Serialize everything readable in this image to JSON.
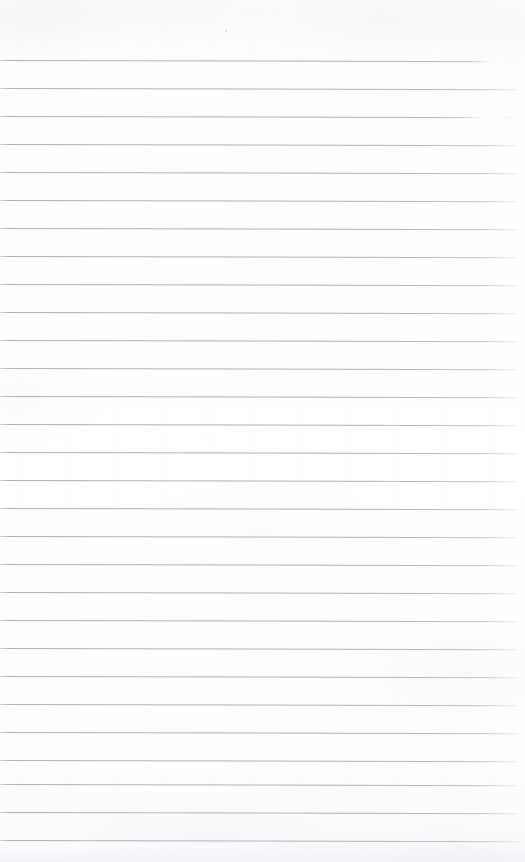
{
  "document": {
    "type": "scanned-ruled-paper",
    "title": "Blank ruled notebook page",
    "content_text": "",
    "page_width": 525,
    "page_height": 862,
    "background_color": "#fdfdfe",
    "rule_color": "#aab2c0",
    "rule_thickness": 1,
    "rule_spacing": 28,
    "first_rule_y": 60,
    "last_rule_y": 840,
    "rule_left_x": 0,
    "rule_right_x": 517,
    "rule_count": 29,
    "has_margin_rule": false,
    "tilt_degrees": 0.13
  },
  "rules": [
    {
      "index": 1,
      "y": 60,
      "right": 517,
      "faded_from": 470,
      "faded_width": 55
    },
    {
      "index": 2,
      "y": 88,
      "right": 517,
      "faded_from": null,
      "faded_width": 0
    },
    {
      "index": 3,
      "y": 116,
      "right": 517,
      "faded_from": 455,
      "faded_width": 70
    },
    {
      "index": 4,
      "y": 144,
      "right": 517,
      "faded_from": null,
      "faded_width": 0
    },
    {
      "index": 5,
      "y": 172,
      "right": 517,
      "faded_from": null,
      "faded_width": 0
    },
    {
      "index": 6,
      "y": 200,
      "right": 517,
      "faded_from": null,
      "faded_width": 0
    },
    {
      "index": 7,
      "y": 228,
      "right": 517,
      "faded_from": null,
      "faded_width": 0
    },
    {
      "index": 8,
      "y": 256,
      "right": 517,
      "faded_from": null,
      "faded_width": 0
    },
    {
      "index": 9,
      "y": 284,
      "right": 517,
      "faded_from": null,
      "faded_width": 0
    },
    {
      "index": 10,
      "y": 312,
      "right": 517,
      "faded_from": null,
      "faded_width": 0
    },
    {
      "index": 11,
      "y": 340,
      "right": 517,
      "faded_from": null,
      "faded_width": 0
    },
    {
      "index": 12,
      "y": 368,
      "right": 517,
      "faded_from": null,
      "faded_width": 0
    },
    {
      "index": 13,
      "y": 396,
      "right": 517,
      "faded_from": null,
      "faded_width": 0
    },
    {
      "index": 14,
      "y": 424,
      "right": 517,
      "faded_from": null,
      "faded_width": 0
    },
    {
      "index": 15,
      "y": 452,
      "right": 517,
      "faded_from": null,
      "faded_width": 0
    },
    {
      "index": 16,
      "y": 480,
      "right": 517,
      "faded_from": null,
      "faded_width": 0
    },
    {
      "index": 17,
      "y": 508,
      "right": 517,
      "faded_from": null,
      "faded_width": 0
    },
    {
      "index": 18,
      "y": 536,
      "right": 517,
      "faded_from": null,
      "faded_width": 0
    },
    {
      "index": 19,
      "y": 564,
      "right": 517,
      "faded_from": null,
      "faded_width": 0
    },
    {
      "index": 20,
      "y": 592,
      "right": 517,
      "faded_from": null,
      "faded_width": 0
    },
    {
      "index": 21,
      "y": 620,
      "right": 517,
      "faded_from": null,
      "faded_width": 0
    },
    {
      "index": 22,
      "y": 648,
      "right": 517,
      "faded_from": null,
      "faded_width": 0
    },
    {
      "index": 23,
      "y": 676,
      "right": 517,
      "faded_from": null,
      "faded_width": 0
    },
    {
      "index": 24,
      "y": 704,
      "right": 517,
      "faded_from": null,
      "faded_width": 0
    },
    {
      "index": 25,
      "y": 732,
      "right": 517,
      "faded_from": null,
      "faded_width": 0
    },
    {
      "index": 26,
      "y": 760,
      "right": 517,
      "faded_from": null,
      "faded_width": 0
    },
    {
      "index": 27,
      "y": 784,
      "right": 517,
      "faded_from": null,
      "faded_width": 0
    },
    {
      "index": 28,
      "y": 812,
      "right": 517,
      "faded_from": null,
      "faded_width": 0
    },
    {
      "index": 29,
      "y": 840,
      "right": 521,
      "faded_from": null,
      "faded_width": 0
    }
  ],
  "artifacts": [
    {
      "kind": "speck",
      "x": 225,
      "y": 30
    }
  ]
}
